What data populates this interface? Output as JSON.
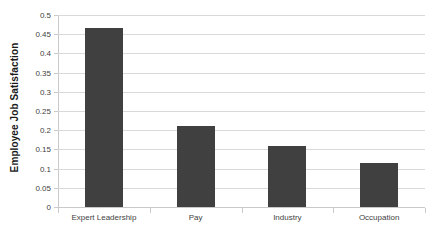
{
  "chart_data": {
    "type": "bar",
    "title": "",
    "xlabel": "",
    "ylabel": "Employee Job Satisfaction",
    "categories": [
      "Expert Leadership",
      "Pay",
      "Industry",
      "Occupation"
    ],
    "values": [
      0.465,
      0.21,
      0.16,
      0.115
    ],
    "ylim": [
      0,
      0.5
    ],
    "ytick_step": 0.05,
    "yticks": [
      "0.5",
      "0.45",
      "0.4",
      "0.35",
      "0.3",
      "0.25",
      "0.2",
      "0.15",
      "0.1",
      "0.05",
      "0"
    ],
    "ytick_values": [
      0.5,
      0.45,
      0.4,
      0.35,
      0.3,
      0.25,
      0.2,
      0.15,
      0.1,
      0.05,
      0
    ],
    "grid": true,
    "grid_axis": "y",
    "legend": false,
    "legend_position": "none",
    "series": [
      {
        "name": "Employee Job Satisfaction",
        "values": [
          0.465,
          0.21,
          0.16,
          0.115
        ]
      }
    ],
    "colors": {
      "bar": "#404040",
      "gridline": "#d9d9d9",
      "axis": "#c9c9c9",
      "text": "#3f3f3f",
      "axis_title": "#1a1a1a",
      "background": "#ffffff"
    }
  }
}
